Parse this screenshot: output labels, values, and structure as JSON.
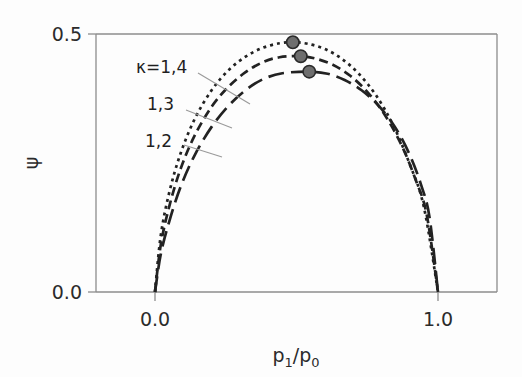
{
  "figure": {
    "background_color": "#fdfdfd",
    "axis_color": "#8d8d8d",
    "curve_color": "#222222",
    "marker_fill": "#6e6e6e"
  },
  "chart_data": {
    "type": "line",
    "title": "",
    "xlabel": "p1/p0",
    "xlabel_parts": {
      "base1": "p",
      "sub1": "1",
      "slash": "/",
      "base2": "p",
      "sub2": "0"
    },
    "ylabel": "ψ",
    "xlim": [
      -0.08,
      1.21
    ],
    "ylim": [
      -0.035,
      0.525
    ],
    "xticks": [
      0.0,
      1.0
    ],
    "xticklabels": [
      "0.0",
      "1.0"
    ],
    "yticks": [
      0.0,
      0.5
    ],
    "yticklabels": [
      "0.0",
      "0.5"
    ],
    "grid": false,
    "legend_position": "inline-annotations",
    "annotations": [
      {
        "text": "κ=1,4",
        "target_series": "kappa=1,4"
      },
      {
        "text": "1,3",
        "target_series": "kappa=1,3"
      },
      {
        "text": "1,2",
        "target_series": "kappa=1,2"
      }
    ],
    "series": [
      {
        "name": "kappa=1,4",
        "label": "κ=1,4",
        "linestyle": "dotted",
        "peak": {
          "x": 0.487,
          "y": 0.484
        },
        "x": [
          0.0,
          0.02,
          0.05,
          0.09,
          0.14,
          0.2,
          0.26,
          0.32,
          0.38,
          0.44,
          0.487,
          0.54,
          0.6,
          0.66,
          0.72,
          0.78,
          0.84,
          0.9,
          0.95,
          1.0
        ],
        "y": [
          0.0,
          0.108,
          0.192,
          0.268,
          0.335,
          0.391,
          0.43,
          0.456,
          0.473,
          0.482,
          0.484,
          0.481,
          0.471,
          0.452,
          0.423,
          0.382,
          0.325,
          0.248,
          0.165,
          0.0
        ]
      },
      {
        "name": "kappa=1,3",
        "label": "1,3",
        "linestyle": "dashed-short",
        "peak": {
          "x": 0.515,
          "y": 0.457
        },
        "x": [
          0.0,
          0.02,
          0.05,
          0.09,
          0.14,
          0.2,
          0.26,
          0.32,
          0.38,
          0.44,
          0.515,
          0.57,
          0.63,
          0.69,
          0.75,
          0.81,
          0.87,
          0.92,
          0.96,
          1.0
        ],
        "y": [
          0.0,
          0.09,
          0.165,
          0.238,
          0.303,
          0.359,
          0.398,
          0.426,
          0.445,
          0.455,
          0.457,
          0.452,
          0.44,
          0.419,
          0.388,
          0.345,
          0.286,
          0.219,
          0.15,
          0.0
        ]
      },
      {
        "name": "kappa=1,2",
        "label": "1,2",
        "linestyle": "dashed-long",
        "peak": {
          "x": 0.545,
          "y": 0.427
        },
        "x": [
          0.0,
          0.02,
          0.05,
          0.09,
          0.14,
          0.2,
          0.26,
          0.32,
          0.38,
          0.45,
          0.545,
          0.61,
          0.67,
          0.73,
          0.79,
          0.85,
          0.9,
          0.94,
          0.97,
          1.0
        ],
        "y": [
          0.0,
          0.072,
          0.136,
          0.203,
          0.265,
          0.32,
          0.361,
          0.391,
          0.412,
          0.424,
          0.427,
          0.423,
          0.411,
          0.391,
          0.361,
          0.318,
          0.266,
          0.208,
          0.145,
          0.0
        ]
      }
    ],
    "markers": [
      {
        "series": "kappa=1,4",
        "x": 0.487,
        "y": 0.484
      },
      {
        "series": "kappa=1,3",
        "x": 0.515,
        "y": 0.457
      },
      {
        "series": "kappa=1,2",
        "x": 0.545,
        "y": 0.427
      }
    ]
  }
}
